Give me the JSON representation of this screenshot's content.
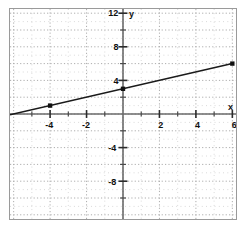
{
  "figure": {
    "background_color": "#ffffff",
    "border_color": "#9a9a9a"
  },
  "chart_data": {
    "type": "line",
    "title": "",
    "xlabel": "x",
    "ylabel": "y",
    "xlim": [
      -6.2,
      6.2
    ],
    "ylim": [
      -12.5,
      12.5
    ],
    "grid": true,
    "grid_style": "dotted",
    "grid_spacing_x": 1,
    "grid_spacing_y": 1,
    "major_grid_spacing_x": 2,
    "major_grid_spacing_y": 2,
    "legend": "none",
    "line_color": "#1a1a1a",
    "marker_color": "#111111",
    "axis_color": "#6b6b6b",
    "grid_color": "#a8a8a8",
    "x_ticks": [
      -4,
      -2,
      2,
      4,
      6
    ],
    "x_tick_labels": [
      "-4",
      "-2",
      "2",
      "4",
      "6"
    ],
    "y_ticks": [
      12,
      8,
      4,
      -4,
      -8
    ],
    "y_tick_labels": [
      "12",
      "8",
      "4",
      "-4",
      "-8"
    ],
    "x_minor_ticks": [
      -5,
      -3,
      -1,
      1,
      3,
      5
    ],
    "y_minor_ticks": [
      10,
      6,
      2,
      -2,
      -6,
      -10
    ],
    "equation": "y = 0.5x + 3",
    "slope": 0.5,
    "intercept": 3,
    "series": [
      {
        "name": "line",
        "x": [
          -6.2,
          6
        ],
        "y": [
          -0.1,
          6
        ]
      }
    ],
    "points": [
      {
        "x": -4,
        "y": 1,
        "label": "(-4, 1)"
      },
      {
        "x": 0,
        "y": 3,
        "label": "(0, 3)"
      },
      {
        "x": 6,
        "y": 6,
        "label": "(6, 6)"
      }
    ]
  }
}
